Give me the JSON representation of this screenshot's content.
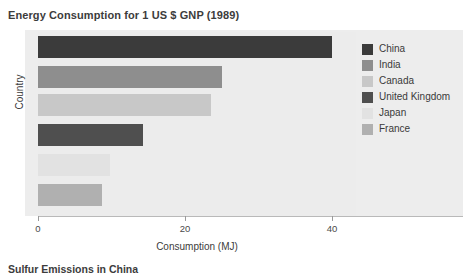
{
  "figure": {
    "title": "Energy Consumption for 1 US $ GNP (1989)",
    "caption": "Sulfur Emissions in China"
  },
  "chart_data": {
    "type": "bar",
    "orientation": "horizontal",
    "title": "Energy Consumption for 1 US $ GNP (1989)",
    "xlabel": "Consumption (MJ)",
    "ylabel": "Country",
    "categories": [
      "China",
      "India",
      "Canada",
      "United Kingdom",
      "Japan",
      "France"
    ],
    "values": [
      40,
      25,
      23.5,
      14.3,
      9.8,
      8.7
    ],
    "xlim": [
      0,
      60
    ],
    "xticks": [
      0,
      20,
      40,
      60
    ],
    "xtick_labels": [
      "0",
      "20",
      "40",
      "60"
    ],
    "grid": false,
    "legend_position": "right",
    "bar_colors": [
      "#3b3b3b",
      "#8e8e8e",
      "#c8c8c8",
      "#4f4f4f",
      "#e2e2e2",
      "#b0b0b0"
    ],
    "plot_background": "#ececec"
  },
  "legend": {
    "items": [
      {
        "label": "China",
        "color": "#3b3b3b"
      },
      {
        "label": "India",
        "color": "#8e8e8e"
      },
      {
        "label": "Canada",
        "color": "#c8c8c8"
      },
      {
        "label": "United Kingdom",
        "color": "#4f4f4f"
      },
      {
        "label": "Japan",
        "color": "#e2e2e2"
      },
      {
        "label": "France",
        "color": "#b0b0b0"
      }
    ]
  }
}
